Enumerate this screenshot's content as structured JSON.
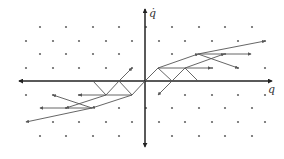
{
  "diagram": {
    "title": "",
    "axes": {
      "horizontal_label": "q",
      "vertical_label": "q̇",
      "origin": [
        145,
        81
      ]
    },
    "colors": {
      "line": "#555555",
      "dot": "#666666",
      "axis": "#222222",
      "background": "#ffffff"
    },
    "lattice_rows": [
      {
        "y": 27,
        "xs": [
          40,
          93,
          146,
          199,
          252,
          66,
          119,
          172,
          225
        ]
      },
      {
        "y": 41,
        "xs": [
          26,
          79,
          132,
          185,
          238,
          53,
          106,
          159,
          212,
          265
        ]
      },
      {
        "y": 54,
        "xs": [
          40,
          93,
          172,
          225,
          66,
          119
        ]
      },
      {
        "y": 68,
        "xs": [
          26,
          79,
          132,
          212,
          265,
          53,
          106,
          238
        ]
      },
      {
        "y": 95,
        "xs": [
          26,
          79,
          185,
          238,
          53,
          212,
          265
        ]
      },
      {
        "y": 108,
        "xs": [
          66,
          119,
          172,
          225,
          146,
          199,
          252
        ]
      },
      {
        "y": 122,
        "xs": [
          53,
          79,
          132,
          185,
          238,
          106,
          159,
          212,
          265
        ]
      },
      {
        "y": 136,
        "xs": [
          40,
          66,
          93,
          119,
          172,
          199,
          225,
          252
        ]
      }
    ],
    "segments": [
      {
        "from": [
          145,
          81
        ],
        "to": [
          158,
          68
        ],
        "arrow": false
      },
      {
        "from": [
          158,
          68
        ],
        "to": [
          172,
          81
        ],
        "arrow": false
      },
      {
        "from": [
          172,
          81
        ],
        "to": [
          185,
          68
        ],
        "arrow": false
      },
      {
        "from": [
          185,
          68
        ],
        "to": [
          198,
          81
        ],
        "arrow": false
      },
      {
        "from": [
          158,
          68
        ],
        "to": [
          198,
          54
        ],
        "arrow": true
      },
      {
        "from": [
          198,
          54
        ],
        "to": [
          265,
          41
        ],
        "arrow": true
      },
      {
        "from": [
          158,
          68
        ],
        "to": [
          211,
          68
        ],
        "arrow": true
      },
      {
        "from": [
          198,
          54
        ],
        "to": [
          251,
          54
        ],
        "arrow": true
      },
      {
        "from": [
          198,
          54
        ],
        "to": [
          238,
          68
        ],
        "arrow": true
      },
      {
        "from": [
          185,
          68
        ],
        "to": [
          224,
          54
        ],
        "arrow": true
      },
      {
        "from": [
          172,
          81
        ],
        "to": [
          158,
          95
        ],
        "arrow": true
      },
      {
        "from": [
          145,
          81
        ],
        "to": [
          132,
          95
        ],
        "arrow": false
      },
      {
        "from": [
          132,
          95
        ],
        "to": [
          119,
          81
        ],
        "arrow": false
      },
      {
        "from": [
          119,
          81
        ],
        "to": [
          106,
          95
        ],
        "arrow": false
      },
      {
        "from": [
          106,
          95
        ],
        "to": [
          93,
          81
        ],
        "arrow": false
      },
      {
        "from": [
          132,
          95
        ],
        "to": [
          92,
          108
        ],
        "arrow": true
      },
      {
        "from": [
          92,
          108
        ],
        "to": [
          26,
          122
        ],
        "arrow": true
      },
      {
        "from": [
          132,
          95
        ],
        "to": [
          79,
          95
        ],
        "arrow": true
      },
      {
        "from": [
          92,
          108
        ],
        "to": [
          40,
          108
        ],
        "arrow": true
      },
      {
        "from": [
          92,
          108
        ],
        "to": [
          53,
          95
        ],
        "arrow": true
      },
      {
        "from": [
          106,
          95
        ],
        "to": [
          66,
          108
        ],
        "arrow": true
      },
      {
        "from": [
          119,
          81
        ],
        "to": [
          132,
          68
        ],
        "arrow": true
      }
    ]
  }
}
